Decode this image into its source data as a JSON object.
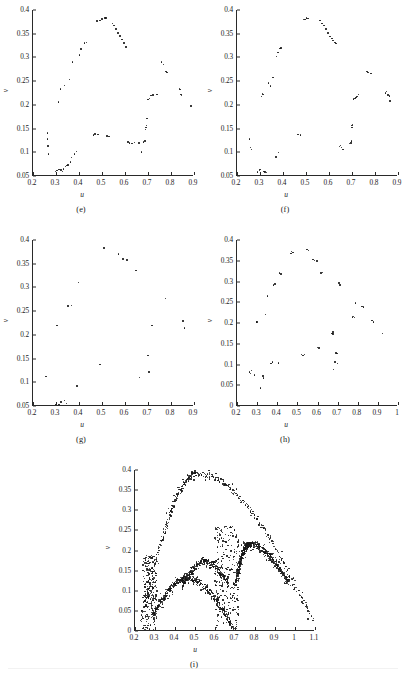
{
  "figure": {
    "axis_label_x": "u",
    "axis_label_y": "v",
    "ink_color": "#161616",
    "axis_color": "#2a2a2a"
  },
  "panels": [
    {
      "id": "e",
      "label": "(e)",
      "xlabel": "u",
      "ylabel": "v",
      "xlim": [
        0.2,
        0.9
      ],
      "ylim": [
        0.05,
        0.4
      ],
      "xticks": [
        "0.2",
        "0.3",
        "0.4",
        "0.5",
        "0.6",
        "0.7",
        "0.8",
        "0.9"
      ],
      "xtickvals": [
        0.2,
        0.3,
        0.4,
        0.5,
        0.6,
        0.7,
        0.8,
        0.9
      ],
      "yticks": [
        "0.05",
        "0.1",
        "0.15",
        "0.2",
        "0.25",
        "0.3",
        "0.35",
        "0.4"
      ],
      "ytickvals": [
        0.05,
        0.1,
        0.15,
        0.2,
        0.25,
        0.3,
        0.35,
        0.4
      ]
    },
    {
      "id": "f",
      "label": "(f)",
      "xlabel": "u",
      "ylabel": "v",
      "xlim": [
        0.2,
        0.9
      ],
      "ylim": [
        0.05,
        0.4
      ],
      "xticks": [
        "0.2",
        "0.3",
        "0.4",
        "0.5",
        "0.6",
        "0.7",
        "0.8",
        "0.9"
      ],
      "xtickvals": [
        0.2,
        0.3,
        0.4,
        0.5,
        0.6,
        0.7,
        0.8,
        0.9
      ],
      "yticks": [
        "0.05",
        "0.1",
        "0.15",
        "0.2",
        "0.25",
        "0.3",
        "0.35",
        "0.4"
      ],
      "ytickvals": [
        0.05,
        0.1,
        0.15,
        0.2,
        0.25,
        0.3,
        0.35,
        0.4
      ]
    },
    {
      "id": "g",
      "label": "(g)",
      "xlabel": "u",
      "ylabel": "v",
      "xlim": [
        0.2,
        0.9
      ],
      "ylim": [
        0.05,
        0.4
      ],
      "xticks": [
        "0.2",
        "0.3",
        "0.4",
        "0.5",
        "0.6",
        "0.7",
        "0.8",
        "0.9"
      ],
      "xtickvals": [
        0.2,
        0.3,
        0.4,
        0.5,
        0.6,
        0.7,
        0.8,
        0.9
      ],
      "yticks": [
        "0.05",
        "0.1",
        "0.15",
        "0.2",
        "0.25",
        "0.3",
        "0.35",
        "0.4"
      ],
      "ytickvals": [
        0.05,
        0.1,
        0.15,
        0.2,
        0.25,
        0.3,
        0.35,
        0.4
      ]
    },
    {
      "id": "h",
      "label": "(h)",
      "xlabel": "u",
      "ylabel": "v",
      "xlim": [
        0.2,
        1.0
      ],
      "ylim": [
        0.0,
        0.4
      ],
      "xticks": [
        "0.2",
        "0.3",
        "0.4",
        "0.5",
        "0.6",
        "0.7",
        "0.8",
        "0.9",
        "1"
      ],
      "xtickvals": [
        0.2,
        0.3,
        0.4,
        0.5,
        0.6,
        0.7,
        0.8,
        0.9,
        1.0
      ],
      "yticks": [
        "0",
        "0.05",
        "0.1",
        "0.15",
        "0.2",
        "0.25",
        "0.3",
        "0.35",
        "0.4"
      ],
      "ytickvals": [
        0,
        0.05,
        0.1,
        0.15,
        0.2,
        0.25,
        0.3,
        0.35,
        0.4
      ]
    },
    {
      "id": "i",
      "label": "(i)",
      "xlabel": "u",
      "ylabel": "v",
      "xlim": [
        0.2,
        1.1
      ],
      "ylim": [
        0.0,
        0.4
      ],
      "xticks": [
        "0.2",
        "0.3",
        "0.4",
        "0.5",
        "0.6",
        "0.7",
        "0.8",
        "0.9",
        "1",
        "1.1"
      ],
      "xtickvals": [
        0.2,
        0.3,
        0.4,
        0.5,
        0.6,
        0.7,
        0.8,
        0.9,
        1.0,
        1.1
      ],
      "yticks": [
        "0",
        "0.05",
        "0.1",
        "0.15",
        "0.2",
        "0.25",
        "0.3",
        "0.35",
        "0.4"
      ],
      "ytickvals": [
        0,
        0.05,
        0.1,
        0.15,
        0.2,
        0.25,
        0.3,
        0.35,
        0.4
      ]
    }
  ],
  "chart_data": [
    {
      "type": "scatter",
      "panel": "e",
      "title": "(e)",
      "xlabel": "u",
      "ylabel": "v",
      "xlim": [
        0.2,
        0.9
      ],
      "ylim": [
        0.05,
        0.4
      ],
      "grid": false,
      "legend": null,
      "points": [
        [
          0.262,
          0.141
        ],
        [
          0.263,
          0.128
        ],
        [
          0.266,
          0.113
        ],
        [
          0.268,
          0.096
        ],
        [
          0.298,
          0.059
        ],
        [
          0.305,
          0.062
        ],
        [
          0.31,
          0.206
        ],
        [
          0.313,
          0.064
        ],
        [
          0.319,
          0.233
        ],
        [
          0.322,
          0.063
        ],
        [
          0.328,
          0.06
        ],
        [
          0.333,
          0.065
        ],
        [
          0.338,
          0.241
        ],
        [
          0.342,
          0.07
        ],
        [
          0.348,
          0.072
        ],
        [
          0.352,
          0.073
        ],
        [
          0.358,
          0.253
        ],
        [
          0.362,
          0.08
        ],
        [
          0.368,
          0.089
        ],
        [
          0.372,
          0.29
        ],
        [
          0.381,
          0.096
        ],
        [
          0.39,
          0.102
        ],
        [
          0.402,
          0.305
        ],
        [
          0.408,
          0.318
        ],
        [
          0.424,
          0.33
        ],
        [
          0.432,
          0.331
        ],
        [
          0.462,
          0.136
        ],
        [
          0.47,
          0.139
        ],
        [
          0.478,
          0.377
        ],
        [
          0.482,
          0.138
        ],
        [
          0.491,
          0.378
        ],
        [
          0.501,
          0.381
        ],
        [
          0.512,
          0.383
        ],
        [
          0.518,
          0.383
        ],
        [
          0.522,
          0.134
        ],
        [
          0.531,
          0.133
        ],
        [
          0.546,
          0.372
        ],
        [
          0.552,
          0.367
        ],
        [
          0.561,
          0.36
        ],
        [
          0.569,
          0.352
        ],
        [
          0.578,
          0.345
        ],
        [
          0.586,
          0.338
        ],
        [
          0.596,
          0.33
        ],
        [
          0.605,
          0.322
        ],
        [
          0.612,
          0.122
        ],
        [
          0.62,
          0.12
        ],
        [
          0.631,
          0.119
        ],
        [
          0.641,
          0.121
        ],
        [
          0.66,
          0.12
        ],
        [
          0.672,
          0.101
        ],
        [
          0.681,
          0.122
        ],
        [
          0.686,
          0.124
        ],
        [
          0.69,
          0.148
        ],
        [
          0.691,
          0.152
        ],
        [
          0.693,
          0.156
        ],
        [
          0.695,
          0.171
        ],
        [
          0.7,
          0.211
        ],
        [
          0.706,
          0.213
        ],
        [
          0.712,
          0.22
        ],
        [
          0.722,
          0.221
        ],
        [
          0.74,
          0.222
        ],
        [
          0.758,
          0.29
        ],
        [
          0.768,
          0.285
        ],
        [
          0.778,
          0.27
        ],
        [
          0.782,
          0.268
        ],
        [
          0.836,
          0.235
        ],
        [
          0.84,
          0.232
        ],
        [
          0.843,
          0.222
        ],
        [
          0.846,
          0.22
        ],
        [
          0.888,
          0.198
        ]
      ]
    },
    {
      "type": "scatter",
      "panel": "f",
      "title": "(f)",
      "xlabel": "u",
      "ylabel": "v",
      "xlim": [
        0.2,
        0.9
      ],
      "ylim": [
        0.05,
        0.4
      ],
      "grid": false,
      "legend": null,
      "points": [
        [
          0.255,
          0.128
        ],
        [
          0.258,
          0.11
        ],
        [
          0.262,
          0.106
        ],
        [
          0.29,
          0.058
        ],
        [
          0.298,
          0.062
        ],
        [
          0.301,
          0.064
        ],
        [
          0.306,
          0.218
        ],
        [
          0.31,
          0.224
        ],
        [
          0.313,
          0.222
        ],
        [
          0.318,
          0.06
        ],
        [
          0.322,
          0.058
        ],
        [
          0.328,
          0.057
        ],
        [
          0.338,
          0.246
        ],
        [
          0.346,
          0.24
        ],
        [
          0.356,
          0.258
        ],
        [
          0.369,
          0.09
        ],
        [
          0.372,
          0.302
        ],
        [
          0.378,
          0.31
        ],
        [
          0.381,
          0.1
        ],
        [
          0.386,
          0.319
        ],
        [
          0.392,
          0.32
        ],
        [
          0.465,
          0.137
        ],
        [
          0.476,
          0.136
        ],
        [
          0.489,
          0.38
        ],
        [
          0.496,
          0.38
        ],
        [
          0.502,
          0.383
        ],
        [
          0.508,
          0.382
        ],
        [
          0.561,
          0.378
        ],
        [
          0.57,
          0.372
        ],
        [
          0.578,
          0.367
        ],
        [
          0.588,
          0.36
        ],
        [
          0.596,
          0.352
        ],
        [
          0.605,
          0.344
        ],
        [
          0.612,
          0.34
        ],
        [
          0.618,
          0.336
        ],
        [
          0.625,
          0.331
        ],
        [
          0.631,
          0.329
        ],
        [
          0.646,
          0.112
        ],
        [
          0.651,
          0.114
        ],
        [
          0.655,
          0.11
        ],
        [
          0.66,
          0.106
        ],
        [
          0.69,
          0.118
        ],
        [
          0.695,
          0.12
        ],
        [
          0.698,
          0.124
        ],
        [
          0.7,
          0.152
        ],
        [
          0.701,
          0.156
        ],
        [
          0.703,
          0.159
        ],
        [
          0.706,
          0.212
        ],
        [
          0.712,
          0.213
        ],
        [
          0.718,
          0.216
        ],
        [
          0.722,
          0.218
        ],
        [
          0.728,
          0.222
        ],
        [
          0.765,
          0.27
        ],
        [
          0.77,
          0.268
        ],
        [
          0.782,
          0.266
        ],
        [
          0.845,
          0.225
        ],
        [
          0.85,
          0.228
        ],
        [
          0.856,
          0.221
        ],
        [
          0.862,
          0.219
        ],
        [
          0.866,
          0.208
        ]
      ]
    },
    {
      "type": "scatter",
      "panel": "g",
      "title": "(g)",
      "xlabel": "u",
      "ylabel": "v",
      "xlim": [
        0.2,
        0.9
      ],
      "ylim": [
        0.05,
        0.4
      ],
      "grid": false,
      "legend": null,
      "points": [
        [
          0.256,
          0.112
        ],
        [
          0.3,
          0.053
        ],
        [
          0.305,
          0.22
        ],
        [
          0.312,
          0.053
        ],
        [
          0.322,
          0.058
        ],
        [
          0.338,
          0.062
        ],
        [
          0.345,
          0.055
        ],
        [
          0.352,
          0.261
        ],
        [
          0.368,
          0.262
        ],
        [
          0.392,
          0.092
        ],
        [
          0.398,
          0.31
        ],
        [
          0.492,
          0.137
        ],
        [
          0.508,
          0.383
        ],
        [
          0.572,
          0.37
        ],
        [
          0.592,
          0.36
        ],
        [
          0.608,
          0.358
        ],
        [
          0.648,
          0.336
        ],
        [
          0.664,
          0.11
        ],
        [
          0.7,
          0.157
        ],
        [
          0.705,
          0.122
        ],
        [
          0.718,
          0.22
        ],
        [
          0.775,
          0.277
        ],
        [
          0.852,
          0.229
        ],
        [
          0.858,
          0.214
        ]
      ]
    },
    {
      "type": "scatter",
      "panel": "h",
      "title": "(h)",
      "xlabel": "u",
      "ylabel": "v",
      "xlim": [
        0.2,
        1.0
      ],
      "ylim": [
        0.0,
        0.4
      ],
      "grid": false,
      "legend": null,
      "points": [
        [
          0.262,
          0.082
        ],
        [
          0.266,
          0.078
        ],
        [
          0.272,
          0.086
        ],
        [
          0.288,
          0.075
        ],
        [
          0.296,
          0.202
        ],
        [
          0.3,
          0.203
        ],
        [
          0.318,
          0.043
        ],
        [
          0.328,
          0.072
        ],
        [
          0.332,
          0.068
        ],
        [
          0.342,
          0.22
        ],
        [
          0.352,
          0.265
        ],
        [
          0.37,
          0.103
        ],
        [
          0.376,
          0.106
        ],
        [
          0.382,
          0.292
        ],
        [
          0.388,
          0.294
        ],
        [
          0.406,
          0.104
        ],
        [
          0.412,
          0.321
        ],
        [
          0.418,
          0.318
        ],
        [
          0.468,
          0.368
        ],
        [
          0.472,
          0.372
        ],
        [
          0.478,
          0.37
        ],
        [
          0.52,
          0.124
        ],
        [
          0.528,
          0.122
        ],
        [
          0.536,
          0.124
        ],
        [
          0.548,
          0.377
        ],
        [
          0.556,
          0.375
        ],
        [
          0.578,
          0.353
        ],
        [
          0.586,
          0.351
        ],
        [
          0.598,
          0.349
        ],
        [
          0.6,
          0.141
        ],
        [
          0.608,
          0.14
        ],
        [
          0.618,
          0.321
        ],
        [
          0.625,
          0.322
        ],
        [
          0.672,
          0.175
        ],
        [
          0.676,
          0.173
        ],
        [
          0.678,
          0.178
        ],
        [
          0.68,
          0.088
        ],
        [
          0.688,
          0.106
        ],
        [
          0.692,
          0.128
        ],
        [
          0.696,
          0.127
        ],
        [
          0.7,
          0.102
        ],
        [
          0.706,
          0.296
        ],
        [
          0.712,
          0.292
        ],
        [
          0.775,
          0.215
        ],
        [
          0.78,
          0.216
        ],
        [
          0.784,
          0.213
        ],
        [
          0.788,
          0.248
        ],
        [
          0.82,
          0.24
        ],
        [
          0.828,
          0.238
        ],
        [
          0.872,
          0.206
        ],
        [
          0.878,
          0.202
        ],
        [
          0.922,
          0.175
        ]
      ]
    },
    {
      "type": "scatter",
      "panel": "i",
      "title": "(i)",
      "xlabel": "u",
      "ylabel": "v",
      "xlim": [
        0.2,
        1.1
      ],
      "ylim": [
        0.0,
        0.4
      ],
      "grid": false,
      "legend": null,
      "description": "Dense chaotic attractor: large outer arc peaking near v=0.39 at u=0.51, an inner arc peaking near v=0.215 at u=0.77, a low arc peaking near v=0.13 at u=0.46, a secondary lobe near v=0.17 at u=0.55, dense vertical filaments near u=0.25-0.30 and u=0.60-0.72, right branch descending to v=0.02 at u=1.1.",
      "structures": [
        {
          "name": "outer-arc",
          "peak": [
            0.51,
            0.39
          ],
          "start": [
            0.23,
            0.02
          ],
          "end": [
            1.1,
            0.02
          ],
          "density": "high"
        },
        {
          "name": "inner-arc",
          "peak": [
            0.77,
            0.215
          ],
          "start": [
            0.7,
            0.11
          ],
          "end": [
            0.97,
            0.12
          ],
          "density": "high"
        },
        {
          "name": "low-arc",
          "peak": [
            0.46,
            0.131
          ],
          "start": [
            0.29,
            0.04
          ],
          "end": [
            0.7,
            0.0
          ],
          "density": "high"
        },
        {
          "name": "secondary-lobe",
          "peak": [
            0.55,
            0.172
          ],
          "start": [
            0.44,
            0.115
          ],
          "end": [
            0.67,
            0.115
          ],
          "density": "medium"
        },
        {
          "name": "left-filament",
          "range_x": [
            0.24,
            0.31
          ],
          "range_y": [
            0.0,
            0.19
          ],
          "density": "high"
        },
        {
          "name": "mid-filament",
          "range_x": [
            0.6,
            0.72
          ],
          "range_y": [
            0.0,
            0.26
          ],
          "density": "high"
        }
      ]
    }
  ]
}
